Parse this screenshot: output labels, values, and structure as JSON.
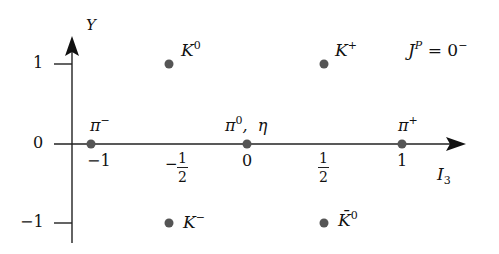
{
  "diagram": {
    "spin_parity_label": {
      "J": "J",
      "P": "P",
      "value": "0",
      "sign": "−"
    },
    "axes": {
      "x": {
        "label": "I",
        "label_sub": "3",
        "ticks": [
          "−1",
          "−",
          "0",
          "",
          "1"
        ],
        "half_num": "1",
        "half_den": "2"
      },
      "y": {
        "label": "Y",
        "ticks": [
          "1",
          "0",
          "−1"
        ]
      }
    },
    "particles": [
      {
        "name": "K",
        "sup": "0",
        "I3": -0.5,
        "Y": 1
      },
      {
        "name": "K",
        "sup": "+",
        "I3": 0.5,
        "Y": 1
      },
      {
        "name": "π",
        "sup": "−",
        "I3": -1,
        "Y": 0
      },
      {
        "name": "π",
        "sup": "0",
        "extra": ",  η",
        "I3": 0,
        "Y": 0
      },
      {
        "name": "π",
        "sup": "+",
        "I3": 1,
        "Y": 0
      },
      {
        "name": "K",
        "sup": "−",
        "I3": -0.5,
        "Y": -1
      },
      {
        "name": "K̄",
        "sup": "0",
        "I3": 0.5,
        "Y": -1
      }
    ],
    "colors": {
      "axis": "#222222",
      "dot": "#555555",
      "text": "#111111"
    }
  }
}
